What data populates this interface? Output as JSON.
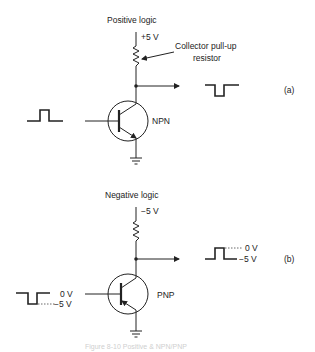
{
  "panel_a": {
    "title": "Positive logic",
    "supply": "+5 V",
    "annotation_line1": "Collector pull-up",
    "annotation_line2": "resistor",
    "transistor": "NPN",
    "tag": "(a)"
  },
  "panel_b": {
    "title": "Negative logic",
    "supply": "−5 V",
    "transistor": "PNP",
    "tag": "(b)",
    "input_high": "0 V",
    "input_low": "−5 V",
    "output_high": "0 V",
    "output_low": "−5 V"
  },
  "caption": "Figure 8-10  Positive & NPN/PNP"
}
